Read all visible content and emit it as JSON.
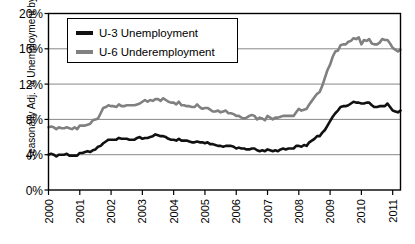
{
  "chart_data": {
    "type": "line",
    "title": "",
    "xlabel": "",
    "ylabel": "Seasonally Adj. % Unemployment by Month",
    "ylim": [
      0,
      20
    ],
    "xlim": [
      2000,
      2011.25
    ],
    "yticks": [
      "0%",
      "4%",
      "8%",
      "12%",
      "16%",
      "20%"
    ],
    "ytick_values": [
      0,
      4,
      8,
      12,
      16,
      20
    ],
    "xticks": [
      "2000",
      "2001",
      "2002",
      "2003",
      "2004",
      "2005",
      "2006",
      "2007",
      "2008",
      "2009",
      "2010",
      "2011"
    ],
    "xtick_values": [
      2000,
      2001,
      2002,
      2003,
      2004,
      2005,
      2006,
      2007,
      2008,
      2009,
      2010,
      2011
    ],
    "grid": "horizontal",
    "legend_position": "top-left-inside",
    "series": [
      {
        "name": "U-3 Unemployment",
        "color": "#111111",
        "values": [
          4.0,
          4.1,
          4.0,
          3.8,
          4.0,
          4.0,
          4.0,
          4.1,
          3.9,
          3.9,
          3.9,
          3.9,
          4.2,
          4.2,
          4.3,
          4.4,
          4.3,
          4.5,
          4.6,
          4.9,
          5.0,
          5.3,
          5.5,
          5.7,
          5.7,
          5.7,
          5.7,
          5.9,
          5.8,
          5.8,
          5.8,
          5.7,
          5.7,
          5.7,
          5.9,
          6.0,
          5.8,
          5.9,
          5.9,
          6.0,
          6.1,
          6.3,
          6.2,
          6.1,
          6.1,
          6.0,
          5.8,
          5.7,
          5.7,
          5.6,
          5.8,
          5.6,
          5.6,
          5.6,
          5.5,
          5.4,
          5.4,
          5.5,
          5.4,
          5.4,
          5.3,
          5.4,
          5.2,
          5.2,
          5.1,
          5.0,
          5.0,
          4.9,
          5.0,
          5.0,
          5.0,
          4.9,
          4.7,
          4.8,
          4.7,
          4.7,
          4.6,
          4.6,
          4.7,
          4.7,
          4.5,
          4.4,
          4.5,
          4.4,
          4.6,
          4.5,
          4.4,
          4.5,
          4.4,
          4.6,
          4.7,
          4.6,
          4.7,
          4.7,
          4.7,
          5.0,
          5.0,
          4.9,
          5.1,
          5.0,
          5.4,
          5.6,
          5.8,
          6.1,
          6.1,
          6.5,
          6.8,
          7.3,
          7.8,
          8.3,
          8.7,
          9.0,
          9.4,
          9.5,
          9.5,
          9.6,
          9.8,
          10.0,
          9.9,
          9.9,
          9.8,
          9.8,
          9.9,
          9.9,
          9.6,
          9.4,
          9.4,
          9.5,
          9.5,
          9.5,
          9.8,
          9.4,
          9.0,
          8.9,
          8.8,
          9.0
        ]
      },
      {
        "name": "U-6 Underemployment",
        "color": "#808080",
        "values": [
          7.1,
          7.2,
          7.1,
          6.9,
          7.1,
          7.0,
          7.0,
          7.1,
          7.0,
          6.9,
          7.1,
          6.9,
          7.3,
          7.3,
          7.3,
          7.4,
          7.5,
          7.9,
          8.0,
          8.1,
          8.7,
          9.3,
          9.4,
          9.6,
          9.5,
          9.5,
          9.4,
          9.7,
          9.5,
          9.5,
          9.6,
          9.6,
          9.6,
          9.6,
          9.7,
          9.8,
          10.0,
          10.2,
          10.0,
          10.2,
          10.1,
          10.3,
          10.3,
          10.1,
          10.4,
          10.2,
          10.0,
          9.9,
          9.9,
          9.7,
          10.0,
          9.6,
          9.6,
          9.5,
          9.5,
          9.4,
          9.4,
          9.7,
          9.4,
          9.2,
          9.3,
          9.3,
          9.1,
          8.9,
          8.9,
          9.0,
          8.8,
          8.9,
          9.0,
          8.7,
          8.7,
          8.6,
          8.4,
          8.4,
          8.2,
          8.1,
          8.2,
          8.4,
          8.5,
          8.4,
          8.0,
          8.2,
          8.1,
          7.9,
          8.4,
          8.2,
          8.0,
          8.2,
          8.2,
          8.3,
          8.4,
          8.4,
          8.4,
          8.4,
          8.4,
          8.8,
          9.2,
          9.0,
          9.1,
          9.2,
          9.7,
          10.1,
          10.5,
          10.9,
          11.1,
          11.8,
          12.7,
          13.6,
          14.2,
          15.1,
          15.7,
          15.8,
          16.4,
          16.5,
          16.5,
          16.8,
          16.9,
          17.2,
          17.1,
          17.3,
          16.5,
          17.0,
          16.9,
          17.1,
          16.6,
          16.5,
          16.5,
          16.7,
          17.1,
          17.0,
          17.0,
          16.6,
          16.1,
          15.9,
          15.7,
          15.9
        ]
      }
    ]
  },
  "legend": {
    "items": [
      {
        "label": "U-3 Unemployment",
        "color": "#111111"
      },
      {
        "label": "U-6 Underemployment",
        "color": "#808080"
      }
    ]
  },
  "axes": {
    "y_axis_title": "Seasonally Adj. % Unemployment by Month"
  }
}
